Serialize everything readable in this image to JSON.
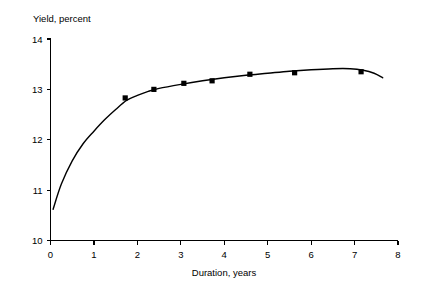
{
  "chart_data": {
    "type": "scatter",
    "title": "",
    "subtitle": "",
    "xlabel": "Duration, years",
    "ylabel": "Yield, percent",
    "xlim": [
      0,
      8
    ],
    "ylim": [
      10,
      14
    ],
    "grid": false,
    "legend": null,
    "x_ticks": [
      0,
      1,
      2,
      3,
      4,
      5,
      6,
      7,
      8
    ],
    "x_tick_labels": [
      "0",
      "1",
      "2",
      "3",
      "4",
      "5",
      "6",
      "7",
      "8"
    ],
    "y_ticks": [
      10,
      11,
      12,
      13,
      14
    ],
    "y_tick_labels": [
      "10",
      "11",
      "12",
      "13",
      "14"
    ],
    "series": [
      {
        "name": "Observed yields",
        "type": "scatter",
        "marker": "square",
        "color": "#000000",
        "points": [
          {
            "x": 1.72,
            "y": 12.83
          },
          {
            "x": 2.38,
            "y": 13.0
          },
          {
            "x": 3.07,
            "y": 13.12
          },
          {
            "x": 3.72,
            "y": 13.17
          },
          {
            "x": 4.59,
            "y": 13.3
          },
          {
            "x": 5.62,
            "y": 13.33
          },
          {
            "x": 7.15,
            "y": 13.35
          }
        ]
      },
      {
        "name": "Fitted yield curve",
        "type": "line",
        "color": "#000000",
        "points": [
          {
            "x": 0.06,
            "y": 10.62
          },
          {
            "x": 0.25,
            "y": 11.12
          },
          {
            "x": 0.5,
            "y": 11.58
          },
          {
            "x": 0.75,
            "y": 11.92
          },
          {
            "x": 1.0,
            "y": 12.17
          },
          {
            "x": 1.25,
            "y": 12.4
          },
          {
            "x": 1.5,
            "y": 12.6
          },
          {
            "x": 1.75,
            "y": 12.78
          },
          {
            "x": 2.0,
            "y": 12.88
          },
          {
            "x": 2.25,
            "y": 12.96
          },
          {
            "x": 2.5,
            "y": 13.02
          },
          {
            "x": 3.0,
            "y": 13.1
          },
          {
            "x": 3.5,
            "y": 13.17
          },
          {
            "x": 4.0,
            "y": 13.23
          },
          {
            "x": 4.5,
            "y": 13.28
          },
          {
            "x": 5.0,
            "y": 13.32
          },
          {
            "x": 5.5,
            "y": 13.36
          },
          {
            "x": 6.0,
            "y": 13.39
          },
          {
            "x": 6.5,
            "y": 13.41
          },
          {
            "x": 6.9,
            "y": 13.41
          },
          {
            "x": 7.2,
            "y": 13.38
          },
          {
            "x": 7.45,
            "y": 13.32
          },
          {
            "x": 7.65,
            "y": 13.23
          }
        ]
      }
    ]
  },
  "labels": {
    "y_axis_title": "Yield, percent",
    "x_axis_title": "Duration, years"
  }
}
